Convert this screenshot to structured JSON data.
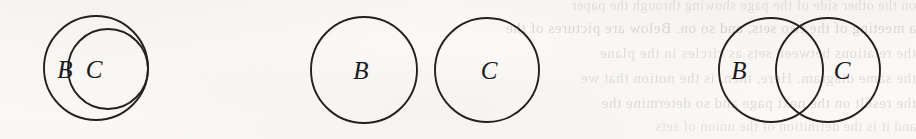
{
  "page": {
    "kind": "scanned-book-figure",
    "background_color": "#faf9f7",
    "ink_color": "#23201d",
    "width": 916,
    "height": 139
  },
  "ghost_text": {
    "note": "faint mirrored bleed-through from the reverse side of the scanned page",
    "lines": [
      "on the other side of the page showing through the paper",
      "a meeting of the two sets, and so on. Below are pictures of the",
      "the relations between sets as circles in the plane",
      "the same diagram. Here, then, is the notion that we",
      "the result on the next page and so determine the",
      "and it is the definition of the union of sets"
    ]
  },
  "figure": {
    "caption": "",
    "diagrams": [
      {
        "id": "subset",
        "name": "c-subset-of-b",
        "description": "Circle C drawn entirely inside circle B",
        "circles": [
          {
            "label": "B",
            "cx": 96,
            "cy": 68,
            "r": 52
          },
          {
            "label": "C",
            "cx": 108,
            "cy": 69,
            "r": 40
          }
        ],
        "labels": [
          {
            "text": "B",
            "x": 65,
            "y": 78
          },
          {
            "text": "C",
            "x": 94,
            "y": 78
          }
        ]
      },
      {
        "id": "disjoint",
        "name": "b-and-c-disjoint",
        "description": "Circle B and circle C separate with no overlap",
        "circles": [
          {
            "label": "B",
            "cx": 364,
            "cy": 70,
            "r": 53
          },
          {
            "label": "C",
            "cx": 487,
            "cy": 70,
            "r": 52
          }
        ],
        "labels": [
          {
            "text": "B",
            "x": 361,
            "y": 79
          },
          {
            "text": "C",
            "x": 489,
            "y": 79
          }
        ]
      },
      {
        "id": "intersecting",
        "name": "b-and-c-overlapping",
        "description": "Circle B and circle C overlapping in a lens-shaped intersection",
        "circles": [
          {
            "label": "B",
            "cx": 771,
            "cy": 70,
            "r": 52
          },
          {
            "label": "C",
            "cx": 828,
            "cy": 70,
            "r": 52
          }
        ],
        "labels": [
          {
            "text": "B",
            "x": 739,
            "y": 79
          },
          {
            "text": "C",
            "x": 842,
            "y": 79
          }
        ]
      }
    ]
  }
}
